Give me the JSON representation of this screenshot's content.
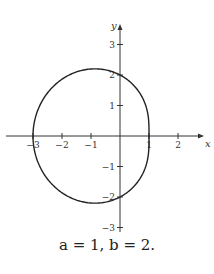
{
  "chart_data": {
    "type": "line",
    "title": "",
    "caption": "a = 1, b = 2.",
    "xlabel": "x",
    "ylabel": "y",
    "xlim": [
      -3.2,
      2.8
    ],
    "ylim": [
      -3.3,
      3.4
    ],
    "x_ticks": [
      -3,
      -2,
      -1,
      1,
      2
    ],
    "x_tick_labels": [
      "-3",
      "-2",
      "-1",
      "1",
      "2"
    ],
    "y_ticks": [
      3,
      2,
      1,
      -1,
      -2,
      -3
    ],
    "y_tick_labels": [
      "3",
      "2",
      "1",
      "-1",
      "-2",
      "-3"
    ],
    "grid": false,
    "legend": null,
    "curve": {
      "description": "Closed polar curve r = b - a cos(theta) with a = 1, b = 2",
      "a": 1,
      "b": 2,
      "key_points": [
        {
          "x": 1,
          "y": 0
        },
        {
          "x": -3,
          "y": 0
        },
        {
          "x": -0.5,
          "y": 2.6
        },
        {
          "x": -0.5,
          "y": -2.6
        },
        {
          "x": 1.4,
          "y": 0.6
        },
        {
          "x": 1.4,
          "y": -0.6
        }
      ]
    },
    "colors": {
      "curve": "#222222",
      "axes": "#333333"
    }
  },
  "caption": {
    "text": "a = 1, b = 2."
  }
}
